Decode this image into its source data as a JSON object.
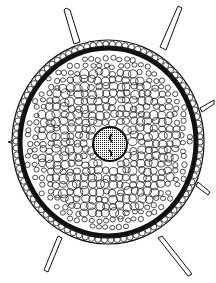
{
  "figure": {
    "style": "black ink line drawing on white",
    "colors": {
      "ink": "#111111",
      "paper": "#ffffff",
      "stele_fill": "#888888"
    },
    "parts": [
      "root hairs",
      "epidermis",
      "cortex cells",
      "endodermis ring",
      "stele"
    ]
  }
}
